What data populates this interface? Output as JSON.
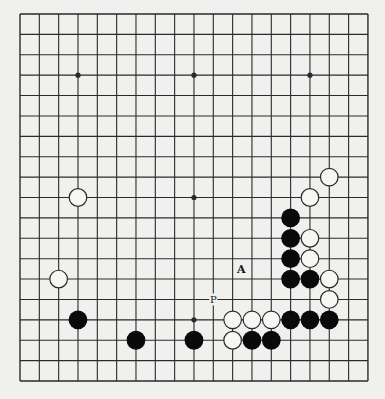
{
  "diagram": {
    "type": "go-board",
    "size": 19,
    "origin": {
      "x": 20,
      "y": 14
    },
    "spacing": {
      "x": 19.33,
      "y": 20.39
    },
    "colors": {
      "background": "#f0f0ee",
      "line": "#2a2a2a",
      "black_stone": "#0a0a0a",
      "white_stone_fill": "#f6f6f4",
      "white_stone_stroke": "#2a2a2a"
    },
    "hoshi": [
      [
        3,
        3
      ],
      [
        9,
        3
      ],
      [
        15,
        3
      ],
      [
        3,
        9
      ],
      [
        9,
        9
      ],
      [
        15,
        9
      ],
      [
        3,
        15
      ],
      [
        9,
        15
      ],
      [
        15,
        15
      ]
    ],
    "stones": [
      {
        "color": "white",
        "col": 3,
        "row": 9
      },
      {
        "color": "white",
        "col": 2,
        "row": 13
      },
      {
        "color": "black",
        "col": 3,
        "row": 15
      },
      {
        "color": "black",
        "col": 6,
        "row": 16
      },
      {
        "color": "black",
        "col": 9,
        "row": 16
      },
      {
        "color": "white",
        "col": 16,
        "row": 8
      },
      {
        "color": "white",
        "col": 15,
        "row": 9
      },
      {
        "color": "black",
        "col": 14,
        "row": 10
      },
      {
        "color": "black",
        "col": 14,
        "row": 11
      },
      {
        "color": "white",
        "col": 15,
        "row": 11
      },
      {
        "color": "black",
        "col": 14,
        "row": 12
      },
      {
        "color": "white",
        "col": 15,
        "row": 12
      },
      {
        "color": "black",
        "col": 14,
        "row": 13
      },
      {
        "color": "black",
        "col": 15,
        "row": 13
      },
      {
        "color": "white",
        "col": 16,
        "row": 13
      },
      {
        "color": "white",
        "col": 16,
        "row": 14
      },
      {
        "color": "white",
        "col": 11,
        "row": 15
      },
      {
        "color": "white",
        "col": 12,
        "row": 15
      },
      {
        "color": "white",
        "col": 13,
        "row": 15
      },
      {
        "color": "black",
        "col": 14,
        "row": 15
      },
      {
        "color": "black",
        "col": 15,
        "row": 15
      },
      {
        "color": "black",
        "col": 16,
        "row": 15
      },
      {
        "color": "white",
        "col": 11,
        "row": 16
      },
      {
        "color": "black",
        "col": 12,
        "row": 16
      },
      {
        "color": "black",
        "col": 13,
        "row": 16
      }
    ],
    "labels": [
      {
        "text": "A",
        "col": 11.45,
        "row": 12.5,
        "size": 11,
        "weight": "bold"
      },
      {
        "text": "P",
        "col": 10,
        "row": 14,
        "size": 10,
        "weight": "normal"
      }
    ]
  }
}
